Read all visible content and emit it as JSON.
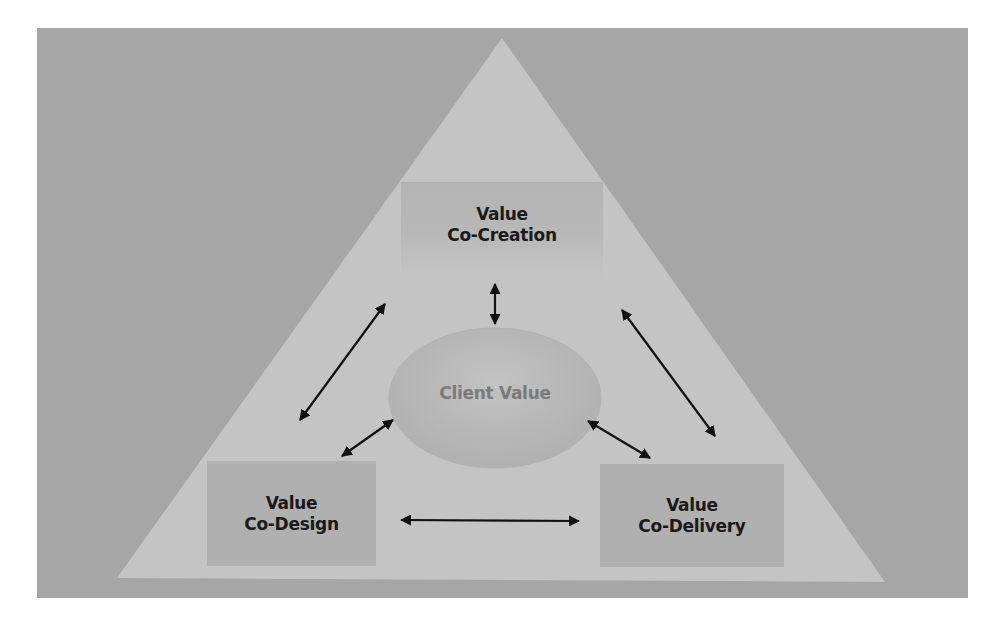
{
  "diagram": {
    "type": "pyramid-cycle",
    "colors": {
      "background": "#a6a6a6",
      "triangle": "#c4c4c4",
      "boxes": "#b0b0b0",
      "sphere": "#b9b9b9",
      "arrows": "#111111",
      "box_text": "#1a1a1a",
      "center_text": "#7a7a7a"
    },
    "center": {
      "label": "Client Value"
    },
    "nodes": [
      {
        "id": "top",
        "line1": "Value",
        "line2": "Co-Creation"
      },
      {
        "id": "left",
        "line1": "Value",
        "line2": "Co-Design"
      },
      {
        "id": "right",
        "line1": "Value",
        "line2": "Co-Delivery"
      }
    ],
    "arrows": [
      {
        "from": "top",
        "to": "center",
        "type": "bidirectional"
      },
      {
        "from": "top",
        "to": "left",
        "type": "bidirectional"
      },
      {
        "from": "top",
        "to": "right",
        "type": "bidirectional"
      },
      {
        "from": "left",
        "to": "center",
        "type": "bidirectional"
      },
      {
        "from": "right",
        "to": "center",
        "type": "bidirectional"
      },
      {
        "from": "left",
        "to": "right",
        "type": "bidirectional"
      }
    ]
  }
}
